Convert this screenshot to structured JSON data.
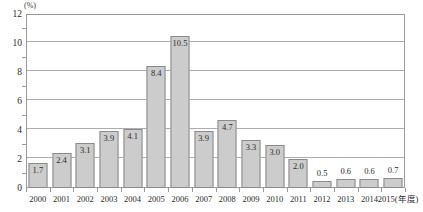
{
  "chart_data": {
    "type": "bar",
    "title": "",
    "subtitle": "",
    "xlabel": "(年度)",
    "ylabel": "(%)",
    "categories": [
      "2000",
      "2001",
      "2002",
      "2003",
      "2004",
      "2005",
      "2006",
      "2007",
      "2008",
      "2009",
      "2010",
      "2011",
      "2012",
      "2013",
      "2014",
      "2015"
    ],
    "values": [
      1.7,
      2.4,
      3.1,
      3.9,
      4.1,
      8.4,
      10.5,
      3.9,
      4.7,
      3.3,
      3.0,
      2.0,
      0.5,
      0.6,
      0.6,
      0.7
    ],
    "value_labels": [
      "1.7",
      "2.4",
      "3.1",
      "3.9",
      "4.1",
      "8.4",
      "10.5",
      "3.9",
      "4.7",
      "3.3",
      "3.0",
      "2.0",
      "0.5",
      "0.6",
      "0.6",
      "0.7"
    ],
    "ylim": [
      0,
      12
    ],
    "yticks": [
      0,
      2,
      4,
      6,
      8,
      10,
      12
    ],
    "ytick_labels": [
      "0",
      "2",
      "4",
      "6",
      "8",
      "10",
      "12"
    ],
    "y_minor_ticks": [
      1,
      3,
      5,
      7,
      9,
      11
    ],
    "grid": true,
    "grid_axis": "y",
    "legend": false,
    "last_category_label": "2015(年度)",
    "bar_fill_color": "#cccccc",
    "bar_border_color": "#8a8a8a",
    "gridline_color": "#adadad",
    "frame_color": "#9a9a9a",
    "text_color": "#2b2b2b"
  }
}
